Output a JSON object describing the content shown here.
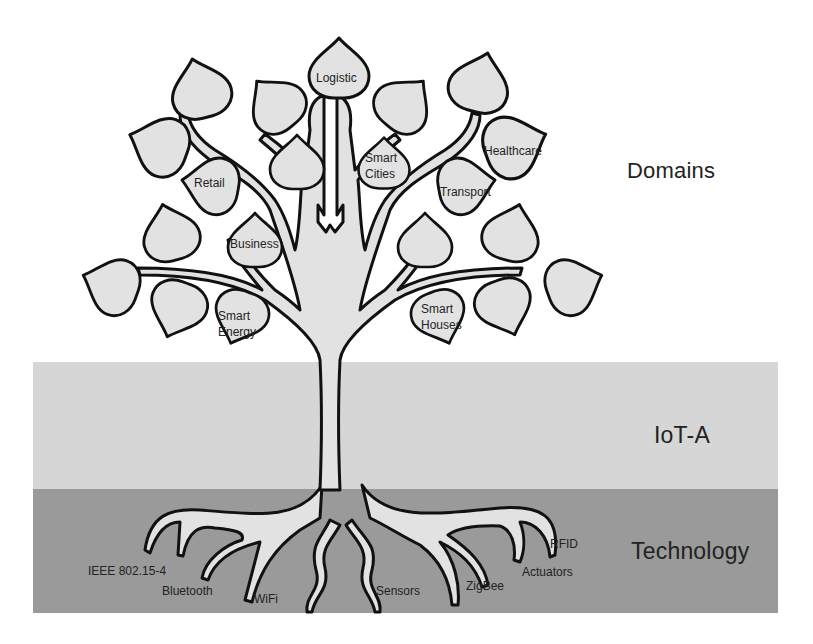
{
  "layers": {
    "domains": "Domains",
    "iot_a": "IoT-A",
    "technology": "Technology"
  },
  "leaves": {
    "logistic": "Logistic",
    "smart_cities_1": "Smart",
    "smart_cities_2": "Cities",
    "healthcare": "Healthcare",
    "transport": "Transport",
    "retail": "Retail",
    "business": "Business",
    "smart_energy_1": "Smart",
    "smart_energy_2": "Energy",
    "smart_houses_1": "Smart",
    "smart_houses_2": "Houses"
  },
  "roots": {
    "ieee": "IEEE 802.15-4",
    "bluetooth": "Bluetooth",
    "wifi": "WiFi",
    "sensors": "Sensors",
    "zigbee": "ZigBee",
    "actuators": "Actuators",
    "rfid": "RFID"
  },
  "colors": {
    "background": "#ffffff",
    "iot_a_band": "#d6d6d6",
    "technology_band": "#9a9a9a",
    "leaf_fill": "#e2e2e2",
    "outline": "#111111"
  }
}
